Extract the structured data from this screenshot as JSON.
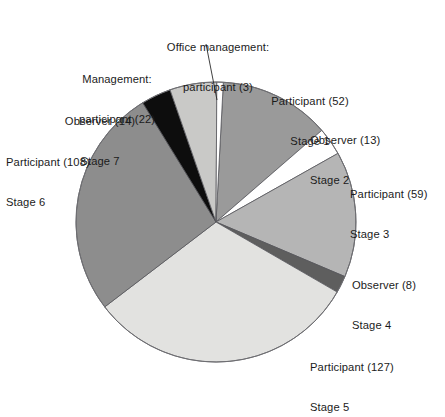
{
  "chart_data": {
    "type": "pie",
    "title": "",
    "subtitle": "",
    "xlabel": "",
    "ylabel": "",
    "legend_position": "callout-labels",
    "grid": false,
    "total": 406,
    "categories": [
      "Participant (52) Stage 1",
      "Observer (13) Stage 2",
      "Participant (59) Stage 3",
      "Observer (8) Stage 4",
      "Participant (127) Stage 5",
      "Participant (108) Stage 6",
      "Observer (14) Stage 7",
      "Management: participant (22)",
      "Office management: participant (3)"
    ],
    "values": [
      52,
      13,
      59,
      8,
      127,
      108,
      14,
      22,
      3
    ],
    "colors": [
      "#9a9a9a",
      "#ffffff",
      "#b5b5b5",
      "#5e5e5e",
      "#e2e2e0",
      "#8d8d8d",
      "#0d0d0d",
      "#c9c9c7",
      "#ffffff"
    ],
    "slices": [
      {
        "id": "stage-1",
        "role": "Participant",
        "count": 52,
        "stage": "Stage 1",
        "color": "#9a9a9a"
      },
      {
        "id": "stage-2",
        "role": "Observer",
        "count": 13,
        "stage": "Stage 2",
        "color": "#ffffff"
      },
      {
        "id": "stage-3",
        "role": "Participant",
        "count": 59,
        "stage": "Stage 3",
        "color": "#b5b5b5"
      },
      {
        "id": "stage-4",
        "role": "Observer",
        "count": 8,
        "stage": "Stage 4",
        "color": "#5e5e5e"
      },
      {
        "id": "stage-5",
        "role": "Participant",
        "count": 127,
        "stage": "Stage 5",
        "color": "#e2e2e0"
      },
      {
        "id": "stage-6",
        "role": "Participant",
        "count": 108,
        "stage": "Stage 6",
        "color": "#8d8d8d"
      },
      {
        "id": "stage-7",
        "role": "Observer",
        "count": 14,
        "stage": "Stage 7",
        "color": "#0d0d0d"
      },
      {
        "id": "management",
        "role": "Management: participant",
        "count": 22,
        "stage": "",
        "color": "#c9c9c7"
      },
      {
        "id": "office-management",
        "role": "Office management: participant",
        "count": 3,
        "stage": "",
        "color": "#ffffff"
      }
    ]
  },
  "labels": {
    "office_management": {
      "line1": "Office management:",
      "line2": "participant (3)"
    },
    "management": {
      "line1": "Management:",
      "line2": "participant (22)"
    },
    "observer_7": {
      "line1": "Observer (14)",
      "line2": "Stage 7"
    },
    "participant_6": {
      "line1": "Participant (108)",
      "line2": "Stage 6"
    },
    "participant_1": {
      "line1": "Participant (52)",
      "line2": "Stage 1"
    },
    "observer_2": {
      "line1": "Observer (13)",
      "line2": "Stage 2"
    },
    "participant_3": {
      "line1": "Participant (59)",
      "line2": "Stage 3"
    },
    "observer_4": {
      "line1": "Observer (8)",
      "line2": "Stage 4"
    },
    "participant_5": {
      "line1": "Participant (127)",
      "line2": "Stage 5"
    }
  }
}
